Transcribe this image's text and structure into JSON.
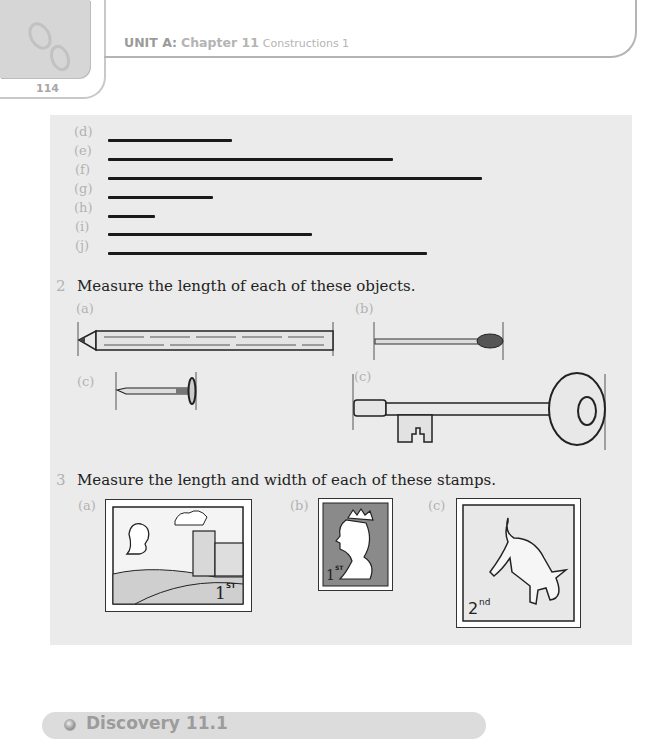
{
  "header": {
    "unit": "UNIT A:",
    "chapter": "Chapter 11",
    "title": "Constructions 1",
    "page_number": "114"
  },
  "question1": {
    "items": [
      {
        "label": "(d)",
        "line_end_x": 232
      },
      {
        "label": "(e)",
        "line_end_x": 393
      },
      {
        "label": "(f)",
        "line_end_x": 482
      },
      {
        "label": "(g)",
        "line_end_x": 213
      },
      {
        "label": "(h)",
        "line_end_x": 155
      },
      {
        "label": "(i)",
        "line_end_x": 312
      },
      {
        "label": "(j)",
        "line_end_x": 427
      }
    ]
  },
  "question2": {
    "number": "2",
    "text": "Measure the length of each of these objects.",
    "objects": [
      {
        "label": "(a)",
        "name": "pencil"
      },
      {
        "label": "(b)",
        "name": "match"
      },
      {
        "label": "(c)",
        "name": "nail"
      },
      {
        "label": "(c)",
        "name": "key"
      }
    ]
  },
  "question3": {
    "number": "3",
    "text": "Measure the length and width of each of these stamps.",
    "stamps": [
      {
        "label": "(a)",
        "value": "1",
        "suffix": "ST",
        "subject": "castle"
      },
      {
        "label": "(b)",
        "value": "1",
        "suffix": "ST",
        "subject": "queen"
      },
      {
        "label": "(c)",
        "value": "2",
        "suffix": "nd",
        "subject": "dog"
      }
    ]
  },
  "discovery": {
    "title": "Discovery 11.1"
  },
  "colors": {
    "panel_bg": "#ebebeb",
    "label_grey": "#b2b2b2",
    "line": "#1a1a1a"
  }
}
